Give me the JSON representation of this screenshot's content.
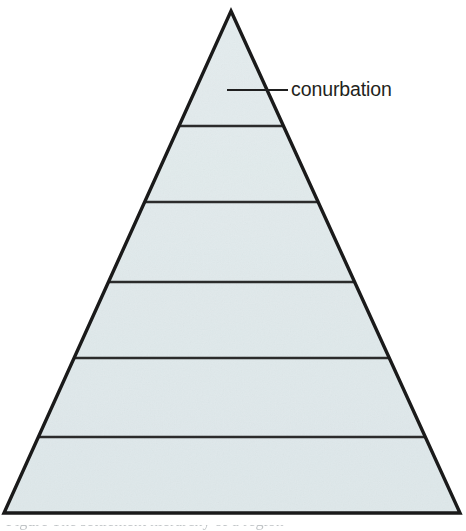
{
  "figure": {
    "kind": "pyramid-diagram",
    "background_color": "#ffffff"
  },
  "chart_data": {
    "type": "pyramid",
    "title": "",
    "subtitle": "",
    "xlabel": "",
    "ylabel": "",
    "grid": false,
    "legend_position": "none",
    "apex": {
      "x": 231,
      "y": 11
    },
    "base_left": {
      "x": 4,
      "y": 513
    },
    "base_right": {
      "x": 460,
      "y": 513
    },
    "tier_count": 6,
    "divider_y_values": [
      126,
      202,
      282,
      358,
      437
    ],
    "tiers": [
      {
        "index": 1,
        "label": "conurbation",
        "top_y": 11,
        "bottom_y": 126,
        "labeled": true
      },
      {
        "index": 2,
        "label": "",
        "top_y": 126,
        "bottom_y": 202,
        "labeled": false
      },
      {
        "index": 3,
        "label": "",
        "top_y": 202,
        "bottom_y": 282,
        "labeled": false
      },
      {
        "index": 4,
        "label": "",
        "top_y": 282,
        "bottom_y": 358,
        "labeled": false
      },
      {
        "index": 5,
        "label": "",
        "top_y": 358,
        "bottom_y": 437,
        "labeled": false
      },
      {
        "index": 6,
        "label": "",
        "top_y": 437,
        "bottom_y": 513,
        "labeled": false
      }
    ],
    "annotations": [
      {
        "text": "conurbation",
        "leader_line_x_start": 227,
        "leader_line_x_end": 288,
        "leader_line_y": 90,
        "text_x": 291,
        "text_baseline_y": 97
      }
    ]
  },
  "colors": {
    "fill": "#dde7e9",
    "fill_light": "#e8eff0",
    "outline": "#1a1a1a",
    "divider": "#2b2b2b",
    "leader_line": "#1f1f1f",
    "text": "#231f20",
    "caption_text": "#8d9499",
    "background": "#ffffff"
  },
  "annotation": {
    "conurbation_label": "conurbation"
  },
  "caption": {
    "cropped_text": "Figure  The settlement hierarchy of a region"
  }
}
